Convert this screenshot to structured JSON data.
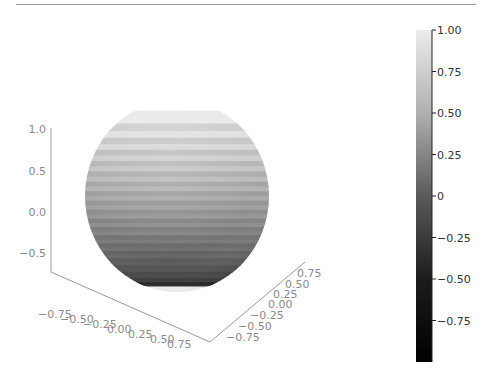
{
  "chart_data": {
    "type": "surface3d",
    "title": "",
    "surface": "sphere",
    "radius": 1.0,
    "colormap": "gray",
    "color_value": "z",
    "bands": 20,
    "z_axis": {
      "ticks": [
        "1.0",
        "0.5",
        "0.0",
        "−0.5"
      ],
      "range": [
        -1,
        1
      ]
    },
    "x_axis": {
      "ticks": [
        "−0.75",
        "−0.50",
        "−0.25",
        "0.00",
        "0.25",
        "0.50",
        "0.75"
      ],
      "range": [
        -1,
        1
      ]
    },
    "y_axis": {
      "ticks": [
        "−0.75",
        "−0.50",
        "−0.25",
        "0.00",
        "0.25",
        "0.50",
        "0.75"
      ],
      "range": [
        -1,
        1
      ]
    },
    "colorbar": {
      "ticks": [
        "1.00",
        "0.75",
        "0.50",
        "0.25",
        "0",
        "−0.25",
        "−0.50",
        "−0.75"
      ],
      "range": [
        -1,
        1
      ],
      "position": "right"
    }
  },
  "colors": {
    "top": "#e6e6e6",
    "bottom": "#000000",
    "axis": "#9a9a9a"
  }
}
